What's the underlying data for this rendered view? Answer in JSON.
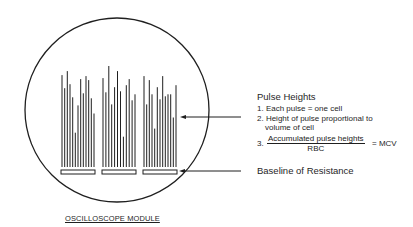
{
  "figure": {
    "caption": "OSCILLOSCOPE MODULE",
    "pulse_groups": [
      {
        "name": "group-1",
        "pulse_relative_heights": [
          0.91,
          0.78,
          0.95,
          0.82,
          0.69,
          0.34,
          0.61,
          0.87,
          0.73,
          0.9,
          0.86,
          0.68,
          0.53
        ]
      },
      {
        "name": "group-2",
        "pulse_relative_heights": [
          0.88,
          0.74,
          1.0,
          0.62,
          0.79,
          0.95,
          0.75,
          0.3,
          0.81,
          0.87,
          0.66,
          0.72
        ]
      },
      {
        "name": "group-3",
        "pulse_relative_heights": [
          0.9,
          0.62,
          0.86,
          0.72,
          0.38,
          0.79,
          0.67,
          0.9,
          0.7,
          0.72,
          0.72,
          0.49,
          0.81
        ]
      }
    ],
    "baseline_count": 3
  },
  "annotations": {
    "pulse_heights_title": "Pulse Heights",
    "item1": "1. Each pulse = one cell",
    "item2_line1": "2. Height of pulse proportional to",
    "item2_line2": "volume of cell",
    "item3_prefix": "3.",
    "item3_numerator": "Accumulated pulse heights",
    "item3_denominator": "RBC",
    "item3_result": "= MCV",
    "baseline_label": "Baseline of Resistance"
  },
  "colors": {
    "ink": "#1f1f1f",
    "background": "#ffffff"
  }
}
